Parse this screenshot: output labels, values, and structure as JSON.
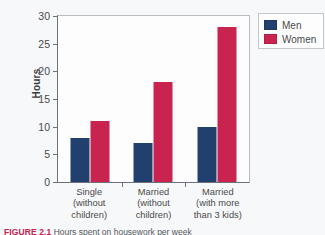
{
  "chart_data": {
    "type": "bar",
    "title": "",
    "xlabel": "",
    "ylabel": "Hours",
    "ylim": [
      0,
      30
    ],
    "yticks": [
      0,
      5,
      10,
      15,
      20,
      25,
      30
    ],
    "grid": false,
    "legend_position": "top-right",
    "categories": [
      "Single (without children)",
      "Married (without children)",
      "Married (with more than 3 kids)"
    ],
    "category_lines": [
      [
        "Single",
        "(without",
        "children)"
      ],
      [
        "Married",
        "(without",
        "children)"
      ],
      [
        "Married",
        "(with more",
        "than 3 kids)"
      ]
    ],
    "series": [
      {
        "name": "Men",
        "color": "#22406e",
        "values": [
          8,
          7,
          10
        ]
      },
      {
        "name": "Women",
        "color": "#c9234f",
        "values": [
          11,
          18,
          28
        ]
      }
    ]
  },
  "legend": {
    "items": [
      {
        "label": "Men",
        "color": "#22406e"
      },
      {
        "label": "Women",
        "color": "#c9234f"
      }
    ]
  },
  "caption": {
    "figure_number": "FIGURE 2.1",
    "text": "Hours spent on housework per week"
  },
  "colors": {
    "men": "#22406e",
    "women": "#c9234f",
    "axis": "#6e7278",
    "text": "#4a4a4a",
    "background": "#f7f8fa"
  }
}
